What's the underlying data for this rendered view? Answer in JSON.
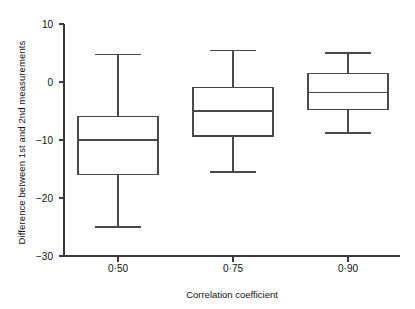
{
  "chart_data": {
    "type": "box",
    "title": "",
    "xlabel": "Correlation coefficient",
    "ylabel": "Difference between 1st and 2nd measurements",
    "categories": [
      "0·50",
      "0·75",
      "0·90"
    ],
    "ylim": [
      -30,
      10
    ],
    "yticks": [
      10,
      0,
      -10,
      -20,
      -30
    ],
    "ytick_labels": [
      "10",
      "0",
      "−10",
      "−20",
      "−30"
    ],
    "grid": false,
    "legend": "none",
    "boxes": [
      {
        "category": "0·50",
        "whisker_high": 4.8,
        "q3": -5.9,
        "median": -10.0,
        "q1": -16.0,
        "whisker_low": -25.0
      },
      {
        "category": "0·75",
        "whisker_high": 5.5,
        "q3": -0.9,
        "median": -5.0,
        "q1": -9.3,
        "whisker_low": -15.5
      },
      {
        "category": "0·90",
        "whisker_high": 5.0,
        "q3": 1.5,
        "median": -1.8,
        "q1": -4.8,
        "whisker_low": -8.8
      }
    ]
  },
  "style": {
    "line_color": "#4a4a4a",
    "axis_color": "#3a3a3a",
    "background": "#ffffff"
  }
}
